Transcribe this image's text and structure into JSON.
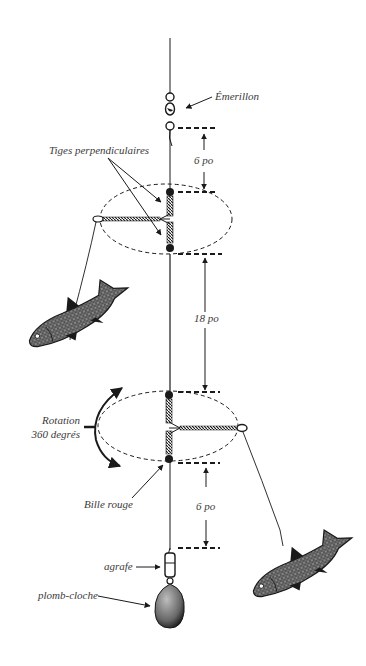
{
  "diagram": {
    "type": "fishing-rig-illustration",
    "language": "fr",
    "colors": {
      "ink": "#1a1a1a",
      "label": "#3a3a3a",
      "background": "#ffffff"
    },
    "labels": {
      "swivel": "Émerillon",
      "rods": "Tiges perpendiculaires",
      "rotation_line1": "Rotation",
      "rotation_line2": "360 degrés",
      "bead": "Bille rouge",
      "snap": "agrafe",
      "sinker": "plomb-cloche"
    },
    "dimensions": {
      "top_gap": "6 po",
      "middle_gap": "18 po",
      "bottom_gap": "6 po"
    },
    "components": [
      {
        "name": "main-line"
      },
      {
        "name": "swivel"
      },
      {
        "name": "upper-spreader",
        "arm": "left",
        "bait": "fish"
      },
      {
        "name": "lower-spreader",
        "arm": "right",
        "bait": "fish"
      },
      {
        "name": "snap"
      },
      {
        "name": "bell-sinker"
      }
    ]
  }
}
